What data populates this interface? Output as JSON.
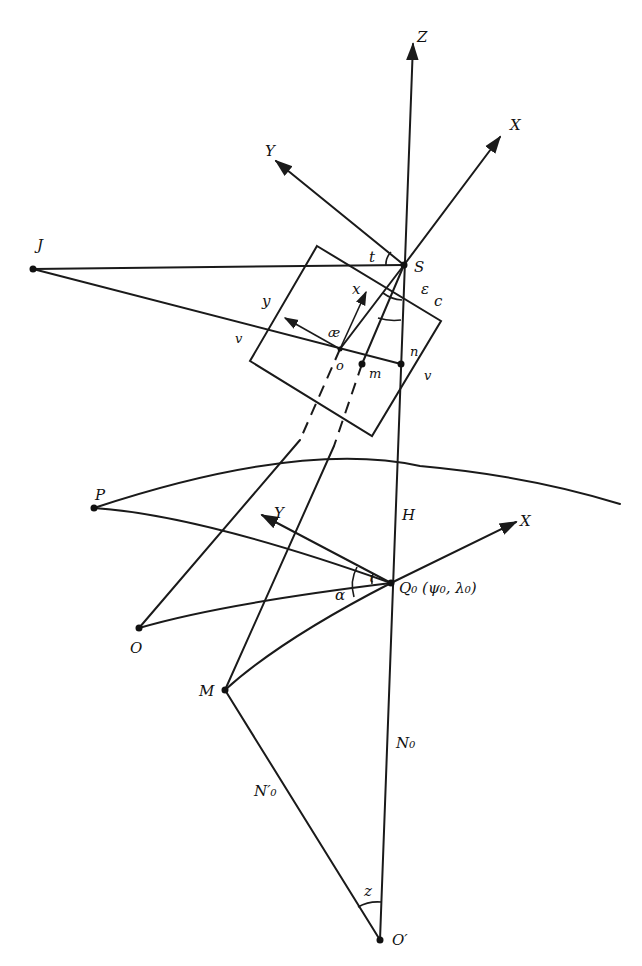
{
  "diagram": {
    "kind": "photogrammetric-geodetic-geometry",
    "labels": {
      "Z": "Z",
      "X_top": "X",
      "Y_top": "Y",
      "S": "S",
      "J": "J",
      "t": "t",
      "epsilon": "ε",
      "c": "c",
      "x_img": "x",
      "y_img": "y",
      "ae": "æ",
      "v_left": "v",
      "o": "o",
      "m": "m",
      "n": "n",
      "v_right": "v",
      "P": "P",
      "H": "H",
      "Y_ground": "Y",
      "X_ground": "X",
      "O": "O",
      "alpha": "α",
      "iota": "ι",
      "Q0": "Q₀ (ψ₀, λ₀)",
      "M": "M",
      "N0": "N₀",
      "N0_prime": "N′₀",
      "z": "z",
      "O_prime": "O′"
    },
    "points": {
      "S": [
        404,
        265
      ],
      "J": [
        33,
        269
      ],
      "o": [
        340,
        349
      ],
      "m": [
        362,
        364
      ],
      "n": [
        401,
        364
      ],
      "P": [
        94,
        508
      ],
      "O": [
        139,
        628
      ],
      "Q0": [
        391,
        583
      ],
      "M": [
        225,
        690
      ],
      "O_prime": [
        380,
        940
      ]
    },
    "colors": {
      "stroke": "#1a1a1a",
      "background": "#ffffff"
    }
  }
}
